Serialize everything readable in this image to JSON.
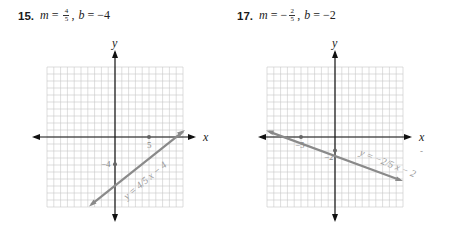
{
  "problems": [
    {
      "number": "15.",
      "m_label": "m",
      "equals": "=",
      "m_sign": "",
      "m_num": "4",
      "m_den": "5",
      "separator": ",",
      "b_label": "b",
      "b_value": "−4",
      "graph": {
        "x_axis_label": "x",
        "y_axis_label": "y",
        "intercept_labels": {
          "y_intercept": "−4",
          "x_intercept": "5"
        },
        "equation_label": "y = 4/5 x − 4"
      }
    },
    {
      "number": "17.",
      "m_label": "m",
      "equals": "=",
      "m_sign": "−",
      "m_num": "2",
      "m_den": "5",
      "separator": ",",
      "b_label": "b",
      "b_value": "−2",
      "graph": {
        "x_axis_label": "x",
        "y_axis_label": "y",
        "intercept_labels": {
          "y_intercept": "−2",
          "x_intercept": "−5"
        },
        "equation_label": "y = −2/5 x − 2",
        "stray_mark": "-"
      }
    }
  ],
  "chart_data": [
    {
      "type": "line",
      "title": "15. m = 4/5, b = −4",
      "xlabel": "x",
      "ylabel": "y",
      "xlim": [
        -10,
        10
      ],
      "ylim": [
        -10,
        10
      ],
      "grid": true,
      "series": [
        {
          "name": "y = 4/5 x − 4",
          "slope": 0.8,
          "intercept": -4,
          "points": [
            {
              "x": 0,
              "y": -4
            },
            {
              "x": 5,
              "y": 0
            }
          ]
        }
      ],
      "annotations": [
        "−4",
        "5",
        "y = 4/5 x − 4"
      ]
    },
    {
      "type": "line",
      "title": "17. m = −2/5, b = −2",
      "xlabel": "x",
      "ylabel": "y",
      "xlim": [
        -10,
        10
      ],
      "ylim": [
        -10,
        10
      ],
      "grid": true,
      "series": [
        {
          "name": "y = −2/5 x − 2",
          "slope": -0.4,
          "intercept": -2,
          "points": [
            {
              "x": -5,
              "y": 0
            },
            {
              "x": 0,
              "y": -2
            }
          ]
        }
      ],
      "annotations": [
        "−5",
        "−2",
        "y = −2/5 x − 2"
      ]
    }
  ]
}
